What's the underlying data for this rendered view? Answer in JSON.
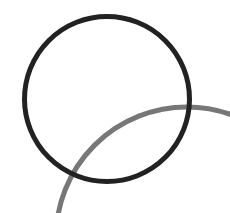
{
  "diagram": {
    "width": 230,
    "height": 213,
    "background": "#ffffff",
    "shapes": [
      {
        "type": "circle",
        "name": "black-circle",
        "cx": 107,
        "cy": 99,
        "r": 82.5,
        "stroke": "#222222",
        "stroke_width": 5
      },
      {
        "type": "arc",
        "name": "gray-arc",
        "cx": 187,
        "cy": 238,
        "r": 131,
        "stroke": "#777777",
        "stroke_width": 5
      }
    ]
  }
}
